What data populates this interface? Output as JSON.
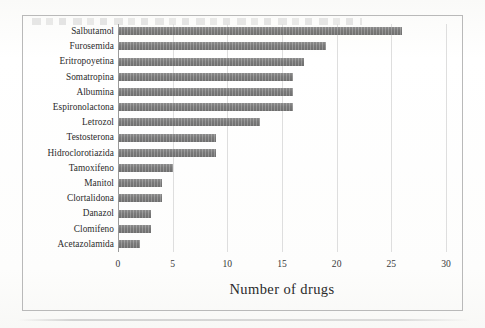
{
  "figure": {
    "frame_border_color": "#b9b9b9",
    "background_color": "#fdfdfc",
    "bar_color": "#7d7d7d",
    "gridline_color": "#dedede",
    "axis_color": "#9a9a9a"
  },
  "chart_data": {
    "type": "bar",
    "orientation": "horizontal",
    "title": "",
    "subtitle": "",
    "xlabel": "Number of drugs",
    "ylabel": "",
    "xlim": [
      0,
      30
    ],
    "xticks": [
      0,
      5,
      10,
      15,
      20,
      25,
      30
    ],
    "xtick_labels": [
      "0",
      "5",
      "10",
      "15",
      "20",
      "25",
      "30"
    ],
    "grid": "vertical",
    "legend": null,
    "categories": [
      "Salbutamol",
      "Furosemida",
      "Eritropoyetina",
      "Somatropina",
      "Albumina",
      "Espironolactona",
      "Letrozol",
      "Testosterona",
      "Hidroclorotiazida",
      "Tamoxifeno",
      "Manitol",
      "Clortalidona",
      "Danazol",
      "Clomifeno",
      "Acetazolamida"
    ],
    "values": [
      26,
      19,
      17,
      16,
      16,
      16,
      13,
      9,
      9,
      5,
      4,
      4,
      3,
      3,
      2
    ],
    "series": [
      {
        "name": "Number of drugs",
        "values": [
          26,
          19,
          17,
          16,
          16,
          16,
          13,
          9,
          9,
          5,
          4,
          4,
          3,
          3,
          2
        ]
      }
    ]
  }
}
